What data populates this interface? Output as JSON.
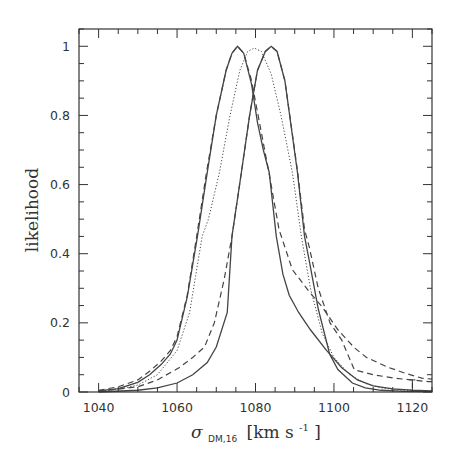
{
  "chart_data": {
    "type": "line",
    "title": "",
    "xlabel": "σ_DM,16 [km s⁻¹]",
    "xlabel_parts": {
      "symbol": "σ",
      "subscript": "DM,16",
      "units": "[km s",
      "sup": "-1",
      "close": "]"
    },
    "ylabel": "likelihood",
    "xlim": [
      1035,
      1125
    ],
    "ylim": [
      0,
      1.05
    ],
    "xticks_major": [
      1040,
      1060,
      1080,
      1100,
      1120
    ],
    "xticks_minor_step": 5,
    "yticks_major": [
      0,
      0.2,
      0.4,
      0.6,
      0.8,
      1
    ],
    "ytick_labels": [
      "0",
      "0.2",
      "0.4",
      "0.6",
      "0.8",
      "1"
    ],
    "yticks_minor_step": 0.05,
    "grid": false,
    "legend": null,
    "series": [
      {
        "name": "left-peak solid",
        "style": "solid",
        "x": [
          1040,
          1045,
          1050,
          1053,
          1056,
          1058.3,
          1060,
          1062.6,
          1065.2,
          1067.7,
          1070,
          1072.5,
          1074,
          1075.4,
          1077,
          1079,
          1080.5,
          1082,
          1083.5,
          1085.3,
          1087,
          1088.6,
          1091,
          1094,
          1098,
          1102,
          1106,
          1110,
          1115,
          1120,
          1125
        ],
        "y": [
          0.003,
          0.01,
          0.028,
          0.05,
          0.08,
          0.11,
          0.15,
          0.275,
          0.45,
          0.635,
          0.8,
          0.93,
          0.98,
          1.0,
          0.98,
          0.89,
          0.78,
          0.7,
          0.635,
          0.45,
          0.34,
          0.28,
          0.23,
          0.18,
          0.122,
          0.07,
          0.035,
          0.018,
          0.009,
          0.005,
          0.003
        ]
      },
      {
        "name": "left-peak dashed",
        "style": "dashed",
        "x": [
          1040,
          1045,
          1050,
          1053,
          1056,
          1058.3,
          1060,
          1062.6,
          1065,
          1067.5,
          1070,
          1072.5,
          1074,
          1075.4,
          1077,
          1079,
          1081,
          1083.5,
          1086,
          1089.4,
          1093.7,
          1097,
          1101,
          1105.2,
          1108.3,
          1113.7,
          1118,
          1122.4,
          1125
        ],
        "y": [
          0.005,
          0.015,
          0.035,
          0.06,
          0.09,
          0.12,
          0.16,
          0.28,
          0.45,
          0.635,
          0.8,
          0.93,
          0.98,
          1.0,
          0.98,
          0.9,
          0.78,
          0.63,
          0.47,
          0.354,
          0.29,
          0.246,
          0.18,
          0.128,
          0.1,
          0.072,
          0.055,
          0.04,
          0.037
        ]
      },
      {
        "name": "central dotted",
        "style": "dotted",
        "x": [
          1040,
          1045,
          1050,
          1055,
          1060,
          1063.2,
          1066.4,
          1068,
          1070.8,
          1073.5,
          1076,
          1078,
          1079.7,
          1081.5,
          1084,
          1086.5,
          1089.4,
          1091.7,
          1094,
          1097,
          1100,
          1104,
          1108,
          1112,
          1117,
          1125
        ],
        "y": [
          0.002,
          0.008,
          0.02,
          0.05,
          0.12,
          0.23,
          0.45,
          0.5,
          0.635,
          0.8,
          0.93,
          0.985,
          0.995,
          0.985,
          0.92,
          0.8,
          0.635,
          0.45,
          0.3,
          0.17,
          0.1,
          0.05,
          0.025,
          0.012,
          0.006,
          0.002
        ]
      },
      {
        "name": "right-peak solid",
        "style": "solid",
        "x": [
          1040,
          1050,
          1055,
          1060,
          1064,
          1067.7,
          1070,
          1072.8,
          1074,
          1076.4,
          1078.5,
          1080.5,
          1082.5,
          1084,
          1085.5,
          1087.5,
          1090.7,
          1092.5,
          1093.7,
          1096,
          1098.9,
          1101,
          1104.7,
          1108,
          1112,
          1118,
          1125
        ],
        "y": [
          0.0,
          0.005,
          0.012,
          0.026,
          0.05,
          0.085,
          0.13,
          0.23,
          0.45,
          0.635,
          0.8,
          0.93,
          0.985,
          1.0,
          0.985,
          0.9,
          0.635,
          0.45,
          0.38,
          0.24,
          0.11,
          0.065,
          0.026,
          0.012,
          0.005,
          0.002,
          0.001
        ]
      },
      {
        "name": "right-peak dashed",
        "style": "dashed",
        "x": [
          1040,
          1050,
          1055,
          1060.5,
          1064,
          1067,
          1069.5,
          1072,
          1074,
          1076.4,
          1078.5,
          1080.5,
          1082.5,
          1084,
          1085.5,
          1087.5,
          1090.7,
          1092.5,
          1093.7,
          1096,
          1099,
          1102,
          1105.2,
          1110,
          1115.4,
          1119,
          1124,
          1125
        ],
        "y": [
          0.002,
          0.015,
          0.035,
          0.07,
          0.1,
          0.13,
          0.2,
          0.325,
          0.45,
          0.635,
          0.8,
          0.93,
          0.985,
          1.0,
          0.985,
          0.9,
          0.64,
          0.47,
          0.42,
          0.3,
          0.2,
          0.15,
          0.064,
          0.05,
          0.04,
          0.036,
          0.03,
          0.03
        ]
      }
    ],
    "annotations": [
      {
        "type": "error-bar-mark",
        "x": 1120,
        "y_from": 0.012,
        "y_to": 0.035
      }
    ]
  }
}
